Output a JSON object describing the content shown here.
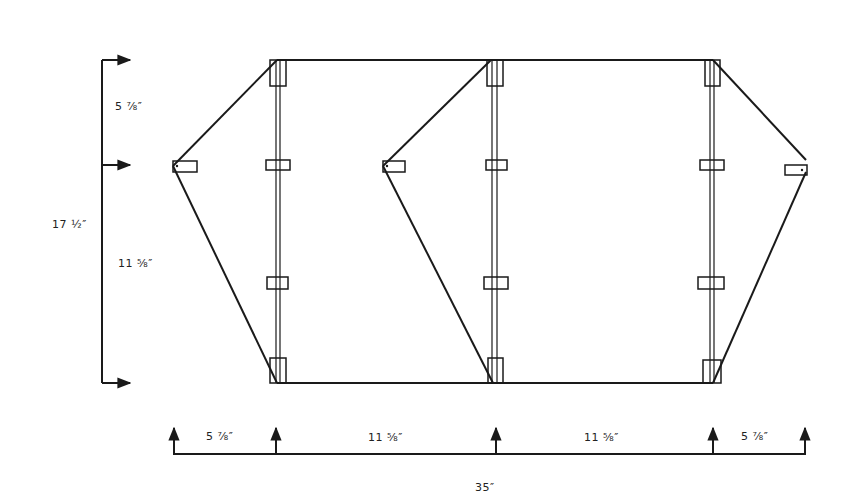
{
  "diagram": {
    "type": "kite plan (two-cell box kite layout)",
    "vertical_dimensions": {
      "total": "17 ½″",
      "upper": "5 ⅞″",
      "lower": "11 ⅝″"
    },
    "horizontal_dimensions": {
      "segments": [
        "5 ⅞″",
        "11 ⅝″",
        "11 ⅝″",
        "5 ⅞″"
      ],
      "total": "35″"
    },
    "colors": {
      "line": "#1a1a1a",
      "background": "#ffffff"
    }
  }
}
